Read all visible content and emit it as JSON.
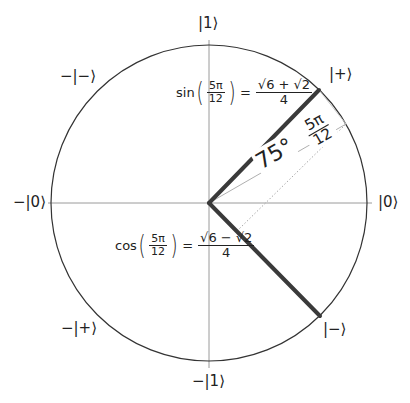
{
  "diagram": {
    "colors": {
      "circle": "#333333",
      "axis": "#999999",
      "vector": "#3a3a3a",
      "guide": "#aaaaaa",
      "text": "#222222"
    },
    "geometry": {
      "center": [
        209,
        203
      ],
      "radius": 158
    },
    "state_labels": {
      "top": "|1⟩",
      "bottom": "−|1⟩",
      "right": "|0⟩",
      "left": "−|0⟩",
      "upper_right": "|+⟩",
      "lower_right": "|−⟩",
      "upper_left": "−|−⟩",
      "lower_left": "−|+⟩"
    },
    "angle": {
      "degrees_label": "75°",
      "radians_numerator": "5π",
      "radians_denominator": "12"
    },
    "sin_formula": {
      "func": "sin",
      "arg_numerator": "5π",
      "arg_denominator": "12",
      "equals": "=",
      "value_numerator": "√6 + √2",
      "value_denominator": "4"
    },
    "cos_formula": {
      "func": "cos",
      "arg_numerator": "5π",
      "arg_denominator": "12",
      "equals": "=",
      "value_numerator": "√6 − √2",
      "value_denominator": "4"
    }
  }
}
